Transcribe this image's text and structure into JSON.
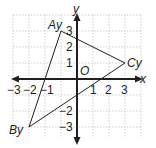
{
  "diagram": {
    "type": "coordinate-plane",
    "axes": {
      "x_label": "x",
      "y_label": "y",
      "origin_label": "O"
    },
    "x_ticks": [
      "−3",
      "−2",
      "−1",
      "1",
      "2",
      "3"
    ],
    "y_ticks": [
      "3",
      "2",
      "1",
      "−2",
      "−3"
    ],
    "range": {
      "x": [
        -3,
        3
      ],
      "y": [
        -3,
        3
      ]
    },
    "grid": true,
    "triangle": {
      "vertices": [
        {
          "label": "Ay",
          "x": -1,
          "y": 3
        },
        {
          "label": "By",
          "x": -3,
          "y": -3
        },
        {
          "label": "Cy",
          "x": 3,
          "y": 1
        }
      ]
    },
    "colors": {
      "axis": "#231f20",
      "grid": "#c8c8c8",
      "triangle": "#231f20"
    }
  }
}
